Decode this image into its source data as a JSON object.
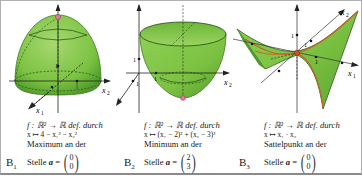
{
  "panels": [
    {
      "id": "B1",
      "label": "B",
      "label_sub": "1",
      "surface": "downward paraboloid (dome)",
      "axes": {
        "x1": "x",
        "x1_sub": "1",
        "x2": "x",
        "x2_sub": "2",
        "unit": "1"
      },
      "caption": {
        "line1": "f : ℝ² → ℝ def. durch",
        "line2": "x ↦ 4 − x₁² − x₂²",
        "line3": "Maximum an der",
        "stelle_label": "Stelle",
        "point_var": "a",
        "equals": "=",
        "vector": [
          "0",
          "0"
        ]
      },
      "point_color": "#e07a9a"
    },
    {
      "id": "B2",
      "label": "B",
      "label_sub": "2",
      "surface": "upward paraboloid (bowl)",
      "axes": {
        "x1": "x",
        "x1_sub": "1",
        "x2": "x",
        "x2_sub": "2",
        "unit": "1"
      },
      "caption": {
        "line1": "f : ℝ² → ℝ def. durch",
        "line2": "x ↦ (x₁ − 2)² + (x₂ − 3)²",
        "line3": "Minimum an der",
        "stelle_label": "Stelle",
        "point_var": "a",
        "equals": "=",
        "vector": [
          "2",
          "3"
        ]
      },
      "point_color": "#e07a9a"
    },
    {
      "id": "B3",
      "label": "B",
      "label_sub": "3",
      "surface": "hyperbolic paraboloid (saddle)",
      "axes": {
        "x1": "x",
        "x1_sub": "1",
        "x2": "x",
        "x2_sub": "2",
        "unit": "1"
      },
      "caption": {
        "line1": "f : ℝ² → ℝ def. durch",
        "line2": "x ↦ x₁ · x₂",
        "line3": "Sattelpunkt an der",
        "stelle_label": "Stelle",
        "point_var": "a",
        "equals": "=",
        "vector": [
          "0",
          "0"
        ]
      },
      "point_color": "#e04a2a"
    }
  ],
  "colors": {
    "surface_green": "#7cc242",
    "surface_dark": "#4f9a2a",
    "surface_light": "#a6d870",
    "curve_orange": "#c8602a",
    "axis": "#222222"
  }
}
